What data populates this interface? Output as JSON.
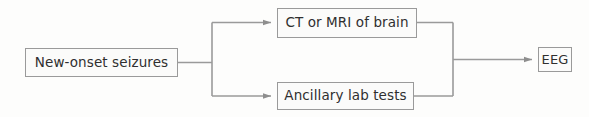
{
  "diagram": {
    "type": "flowchart",
    "orientation": "left-to-right",
    "colors": {
      "line": "#9a9a9a",
      "box_border": "#9a9a9a",
      "box_fill": "#fbfbfa",
      "text": "#2f2f2f",
      "background": "#fdfdfc",
      "arrowhead": "#8e8e8e"
    },
    "nodes": [
      {
        "id": "seizures",
        "label": "New-onset seizures",
        "role": "start"
      },
      {
        "id": "imaging",
        "label": "CT or MRI of brain",
        "role": "branch-top"
      },
      {
        "id": "labs",
        "label": "Ancillary lab tests",
        "role": "branch-bottom"
      },
      {
        "id": "eeg",
        "label": "EEG",
        "role": "end"
      }
    ],
    "edges": [
      {
        "id": "seizures-to-split",
        "from": "seizures",
        "to": "split-junction",
        "arrowhead": false
      },
      {
        "id": "split-to-imaging",
        "from": "split-junction",
        "to": "imaging",
        "arrowhead": true
      },
      {
        "id": "split-to-labs",
        "from": "split-junction",
        "to": "labs",
        "arrowhead": true
      },
      {
        "id": "imaging-to-merge",
        "from": "imaging",
        "to": "merge-junction",
        "arrowhead": false
      },
      {
        "id": "labs-to-merge",
        "from": "labs",
        "to": "merge-junction",
        "arrowhead": false
      },
      {
        "id": "merge-to-eeg",
        "from": "merge-junction",
        "to": "eeg",
        "arrowhead": true
      }
    ]
  }
}
